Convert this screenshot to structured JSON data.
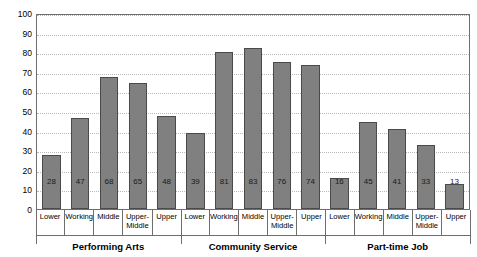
{
  "chart_data": {
    "type": "bar",
    "title": "",
    "xlabel": "",
    "ylabel": "Percent Participating",
    "ylim": [
      0,
      100
    ],
    "yticks": [
      0,
      10,
      20,
      30,
      40,
      50,
      60,
      70,
      80,
      90,
      100
    ],
    "grid": true,
    "legend": "none",
    "categories": [
      "Lower",
      "Working",
      "Middle",
      "Upper-Middle",
      "Upper"
    ],
    "groups": [
      {
        "name": "Performing Arts",
        "values": [
          28,
          47,
          68,
          65,
          48
        ]
      },
      {
        "name": "Community Service",
        "values": [
          39,
          81,
          83,
          76,
          74
        ]
      },
      {
        "name": "Part-time Job",
        "values": [
          16,
          45,
          41,
          33,
          13
        ]
      }
    ],
    "bars": [
      {
        "group": "Performing Arts",
        "category": "Lower",
        "value": 28,
        "label": "28"
      },
      {
        "group": "Performing Arts",
        "category": "Working",
        "value": 47,
        "label": "47"
      },
      {
        "group": "Performing Arts",
        "category": "Middle",
        "value": 68,
        "label": "68"
      },
      {
        "group": "Performing Arts",
        "category": "Upper-Middle",
        "value": 65,
        "label": "65"
      },
      {
        "group": "Performing Arts",
        "category": "Upper",
        "value": 48,
        "label": "48"
      },
      {
        "group": "Community Service",
        "category": "Lower",
        "value": 39,
        "label": "39"
      },
      {
        "group": "Community Service",
        "category": "Working",
        "value": 81,
        "label": "81"
      },
      {
        "group": "Community Service",
        "category": "Middle",
        "value": 83,
        "label": "83"
      },
      {
        "group": "Community Service",
        "category": "Upper-Middle",
        "value": 76,
        "label": "76"
      },
      {
        "group": "Community Service",
        "category": "Upper",
        "value": 74,
        "label": "74"
      },
      {
        "group": "Part-time Job",
        "category": "Lower",
        "value": 16,
        "label": "16"
      },
      {
        "group": "Part-time Job",
        "category": "Working",
        "value": 45,
        "label": "45"
      },
      {
        "group": "Part-time Job",
        "category": "Middle",
        "value": 41,
        "label": "41"
      },
      {
        "group": "Part-time Job",
        "category": "Upper-Middle",
        "value": 33,
        "label": "33"
      },
      {
        "group": "Part-time Job",
        "category": "Upper",
        "value": 13,
        "label": "13"
      }
    ],
    "colors": {
      "bar_fill": "#808080",
      "bar_border": "#4a4a4a",
      "gridline": "#b9b9b9",
      "axis": "#6e6e6e",
      "text": "#000000",
      "background": "#ffffff"
    }
  }
}
